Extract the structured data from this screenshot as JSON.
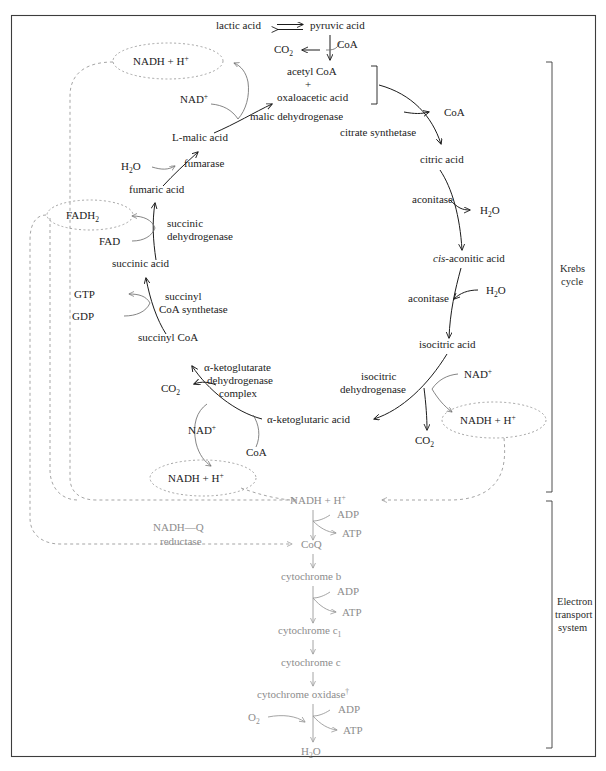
{
  "figure": {
    "title_hidden": "",
    "frame": {
      "color": "#3d3d3d"
    }
  },
  "colors": {
    "krebs_text": "#1c1c1c",
    "ets_text": "#8d8d8d",
    "dashed": "#9b9b9b",
    "thin_arrow": "#6f6f6f"
  },
  "side_labels": [
    {
      "name": "krebs-cycle",
      "line1": "Krebs",
      "line2": "cycle",
      "line3": ""
    },
    {
      "name": "electron-transport-system",
      "line1": "Electron",
      "line2": "transport",
      "line3": "system"
    }
  ],
  "glycolysis_entry": {
    "lactic_acid": "lactic acid",
    "pyruvic_acid": "pyruvic acid",
    "co2": "CO",
    "co2_sub": "2",
    "coa": "CoA"
  },
  "krebs": {
    "metabolites": [
      {
        "id": "acetyl-coa",
        "label": "acetyl CoA"
      },
      {
        "id": "plus-sign",
        "label": "+"
      },
      {
        "id": "oxaloacetic-acid",
        "label": "oxaloacetic acid"
      },
      {
        "id": "citric-acid",
        "label": "citric acid"
      },
      {
        "id": "cis-aconitic-acid",
        "label_italic": "cis",
        "label_rest": "-aconitic acid"
      },
      {
        "id": "isocitric-acid",
        "label": "isocitric acid"
      },
      {
        "id": "alpha-ketoglutaric-acid",
        "label": "α-ketoglutaric acid"
      },
      {
        "id": "succinyl-coa",
        "label": "succinyl CoA"
      },
      {
        "id": "succinic-acid",
        "label": "succinic acid"
      },
      {
        "id": "fumaric-acid",
        "label": "fumaric acid"
      },
      {
        "id": "l-malic-acid",
        "label": "L-malic acid"
      }
    ],
    "enzymes": [
      {
        "id": "citrate-synthetase",
        "label": "citrate synthetase"
      },
      {
        "id": "aconitase-1",
        "label": "aconitase"
      },
      {
        "id": "aconitase-2",
        "label": "aconitase"
      },
      {
        "id": "isocitric-dehydrogenase",
        "line1": "isocitric",
        "line2": "dehydrogenase"
      },
      {
        "id": "alpha-ketoglutarate-dehydrogenase-complex",
        "line1": "α-ketoglutarate",
        "line2": "dehydrogenase",
        "line3": "complex"
      },
      {
        "id": "succinyl-coa-synthetase",
        "line1": "succinyl",
        "line2": "CoA synthetase"
      },
      {
        "id": "succinic-dehydrogenase",
        "line1": "succinic",
        "line2": "dehydrogenase"
      },
      {
        "id": "fumarase",
        "label": "fumarase"
      },
      {
        "id": "malic-dehydrogenase",
        "label": "malic dehydrogenase"
      }
    ],
    "cofactors": {
      "coa_released": "CoA",
      "h2o_released": "H",
      "h2o_sub": "2",
      "h2o_rest": "O",
      "nad_plus": "NAD",
      "nad_sup": "+",
      "co2": "CO",
      "co2_sub": "2",
      "coa_in": "CoA",
      "gtp": "GTP",
      "gdp": "GDP",
      "fad": "FAD",
      "fadh2": "FADH",
      "fadh2_sub": "2",
      "nadh_h": "NADH + H",
      "nadh_h_sup": "+"
    }
  },
  "ets": {
    "chain": [
      {
        "id": "nadh-h-ets",
        "label": "NADH + H",
        "sup": "+"
      },
      {
        "id": "coq",
        "label": "CoQ",
        "sup": ""
      },
      {
        "id": "cytochrome-b",
        "label": "cytochrome b",
        "sup": ""
      },
      {
        "id": "cytochrome-c1",
        "label": "cytochrome c",
        "sub": "1"
      },
      {
        "id": "cytochrome-c",
        "label": "cytochrome c",
        "sup": ""
      },
      {
        "id": "cytochrome-oxidase",
        "label": "cytochrome oxidase",
        "sup": "†"
      },
      {
        "id": "water-product",
        "label": "H",
        "sub": "2",
        "rest": "O"
      }
    ],
    "enzyme": {
      "id": "nadh-q-reductase",
      "line1": "NADH—Q",
      "line2": "reductase"
    },
    "couples": [
      {
        "id": "atp-couple-1",
        "adp": "ADP",
        "atp": "ATP"
      },
      {
        "id": "atp-couple-2",
        "adp": "ADP",
        "atp": "ATP"
      },
      {
        "id": "atp-couple-3",
        "adp": "ADP",
        "atp": "ATP"
      }
    ],
    "oxygen": {
      "id": "oxygen-input",
      "label": "O",
      "sub": "2"
    }
  }
}
